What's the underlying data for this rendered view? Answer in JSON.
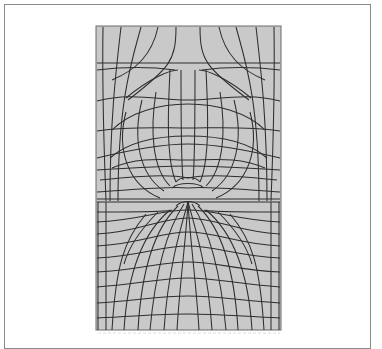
{
  "figure": {
    "title": "",
    "caption": "",
    "panel": {
      "x": 96,
      "y": 26,
      "width": 185,
      "height": 304
    },
    "interface_y": 201,
    "singular_point": {
      "x": 188,
      "y": 195
    },
    "colors": {
      "panel_fill": "#c9c9c9",
      "line": "#2e2e2e",
      "frame": "#8a8a8a",
      "background": "#ffffff"
    }
  }
}
